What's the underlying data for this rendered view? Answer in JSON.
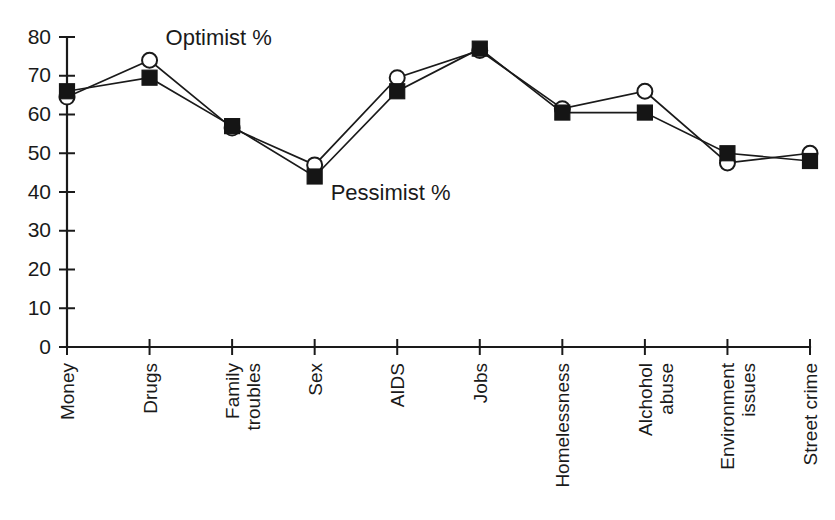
{
  "chart_data": {
    "type": "line",
    "title": "",
    "xlabel": "",
    "ylabel": "",
    "ylim": [
      0,
      80
    ],
    "ytick_step": 10,
    "grid": false,
    "legend_position": "inline-annotations",
    "categories": [
      "Money",
      "Drugs",
      "Family troubles",
      "Sex",
      "AIDS",
      "Jobs",
      "Homelessness",
      "Alchohol abuse",
      "Environment issues",
      "Street crime"
    ],
    "category_lines": [
      [
        "Money"
      ],
      [
        "Drugs"
      ],
      [
        "Family",
        "troubles"
      ],
      [
        "Sex"
      ],
      [
        "AIDS"
      ],
      [
        "Jobs"
      ],
      [
        "Homelessness"
      ],
      [
        "Alchohol",
        "abuse"
      ],
      [
        "Environment",
        "issues"
      ],
      [
        "Street crime"
      ]
    ],
    "ytick_labels": [
      "0",
      "10",
      "20",
      "30",
      "40",
      "50",
      "60",
      "70",
      "80"
    ],
    "ytick_values": [
      0,
      10,
      20,
      30,
      40,
      50,
      60,
      70,
      80
    ],
    "series": [
      {
        "name": "Optimist %",
        "marker": "open-circle",
        "values": [
          64.5,
          74,
          56.5,
          47,
          69.5,
          76.5,
          61.5,
          66,
          47.5,
          50
        ]
      },
      {
        "name": "Pessimist %",
        "marker": "filled-square",
        "values": [
          66,
          69.5,
          57,
          44,
          66,
          77,
          60.5,
          60.5,
          50,
          48
        ]
      }
    ],
    "annotations": [
      {
        "text": "Optimist %",
        "x_category": "Drugs",
        "y_value": 78
      },
      {
        "text": "Pessimist %",
        "x_category": "Sex",
        "y_value": 38
      }
    ]
  },
  "colors": {
    "ink": "#1a1a1a",
    "marker_fill": "#151515",
    "background": "#ffffff"
  }
}
